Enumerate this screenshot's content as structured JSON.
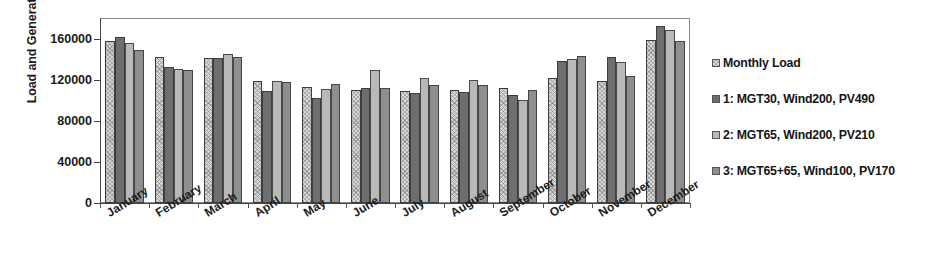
{
  "chart_data": {
    "type": "bar",
    "title": "",
    "xlabel": "",
    "ylabel": "Load and Generation (kWh)",
    "ylim": [
      0,
      180000
    ],
    "yticks": [
      0,
      40000,
      80000,
      120000,
      160000
    ],
    "ytick_labels": [
      "0",
      "40000",
      "80000",
      "120000",
      "160000"
    ],
    "grid": false,
    "legend_position": "right",
    "categories": [
      "January",
      "February",
      "March",
      "April",
      "May",
      "June",
      "July",
      "August",
      "September",
      "October",
      "November",
      "December"
    ],
    "series": [
      {
        "name": "Monthly Load",
        "color": "#d8d8d8",
        "pattern": "cross-hatch",
        "values": [
          158000,
          142000,
          141000,
          119000,
          113000,
          110000,
          109000,
          110000,
          112000,
          122000,
          119000,
          159000
        ]
      },
      {
        "name": "1: MGT30, Wind200, PV490",
        "color": "#6e6e6e",
        "pattern": "solid-dark",
        "values": [
          162000,
          132000,
          141000,
          109000,
          102000,
          112000,
          107000,
          108000,
          105000,
          138000,
          142000,
          172000
        ]
      },
      {
        "name": "2: MGT65, Wind200, PV210",
        "color": "#b9b9b9",
        "pattern": "solid-light",
        "values": [
          156000,
          130000,
          145000,
          119000,
          111000,
          129000,
          122000,
          120000,
          100000,
          140000,
          137000,
          168000
        ]
      },
      {
        "name": "3: MGT65+65, Wind100, PV170",
        "color": "#8f8f8f",
        "pattern": "solid-medium",
        "values": [
          149000,
          129000,
          142000,
          118000,
          116000,
          112000,
          115000,
          115000,
          110000,
          143000,
          124000,
          158000
        ]
      }
    ]
  },
  "legend": {
    "entries": [
      {
        "label": "Monthly Load"
      },
      {
        "label": "1: MGT30, Wind200, PV490"
      },
      {
        "label": "2: MGT65, Wind200, PV210"
      },
      {
        "label": "3: MGT65+65, Wind100, PV170"
      }
    ]
  }
}
